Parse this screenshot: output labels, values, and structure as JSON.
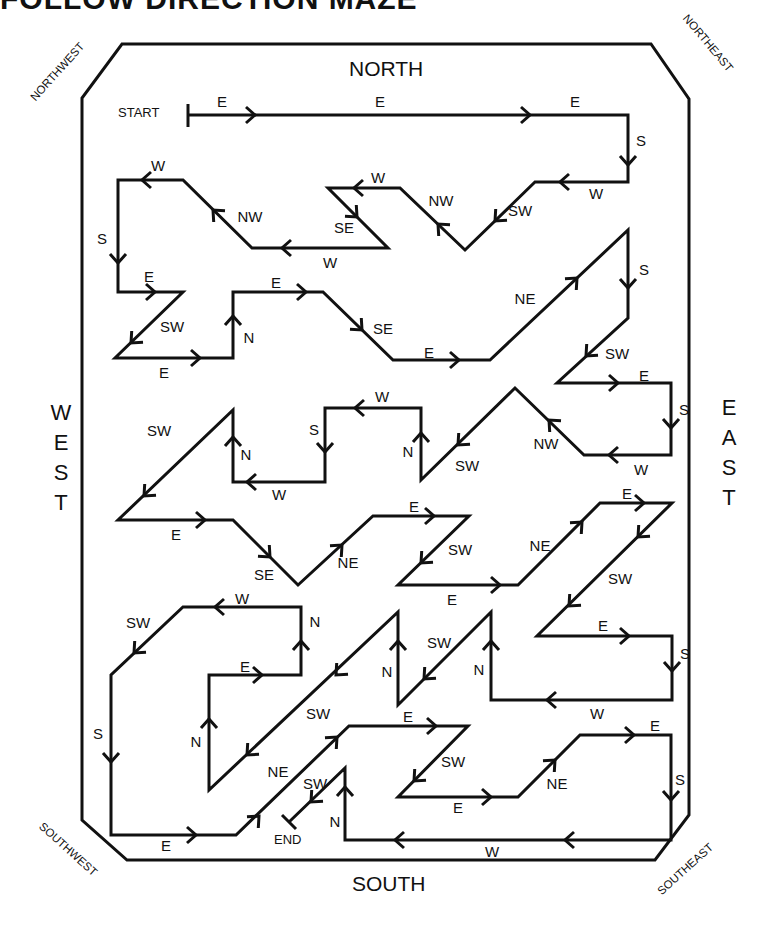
{
  "title": "FOLLOW DIRECTION MAZE",
  "compass": {
    "north": "NORTH",
    "south": "SOUTH",
    "west": [
      "W",
      "E",
      "S",
      "T"
    ],
    "east": [
      "E",
      "A",
      "S",
      "T"
    ],
    "northwest": "NORTHWEST",
    "northeast": "NORTHEAST",
    "southwest": "SOUTHWEST",
    "southeast": "SOUTHEAST"
  },
  "markers": {
    "start": "START",
    "end": "END"
  },
  "colors": {
    "ink": "#111111",
    "background": "#ffffff"
  },
  "path_points": [
    [
      188,
      115
    ],
    [
      628,
      115
    ],
    [
      628,
      182
    ],
    [
      535,
      182
    ],
    [
      465,
      250
    ],
    [
      400,
      188
    ],
    [
      328,
      188
    ],
    [
      388,
      248
    ],
    [
      252,
      248
    ],
    [
      183,
      180
    ],
    [
      118,
      180
    ],
    [
      118,
      292
    ],
    [
      183,
      292
    ],
    [
      115,
      358
    ],
    [
      233,
      358
    ],
    [
      233,
      292
    ],
    [
      323,
      292
    ],
    [
      393,
      360
    ],
    [
      490,
      360
    ],
    [
      628,
      230
    ],
    [
      628,
      318
    ],
    [
      557,
      383
    ],
    [
      671,
      383
    ],
    [
      671,
      455
    ],
    [
      584,
      455
    ],
    [
      515,
      388
    ],
    [
      421,
      480
    ],
    [
      421,
      408
    ],
    [
      325,
      408
    ],
    [
      325,
      482
    ],
    [
      233,
      482
    ],
    [
      233,
      410
    ],
    [
      118,
      520
    ],
    [
      233,
      520
    ],
    [
      298,
      585
    ],
    [
      373,
      516
    ],
    [
      469,
      516
    ],
    [
      398,
      585
    ],
    [
      518,
      585
    ],
    [
      600,
      503
    ],
    [
      672,
      503
    ],
    [
      537,
      636
    ],
    [
      672,
      636
    ],
    [
      672,
      700
    ],
    [
      491,
      700
    ],
    [
      491,
      612
    ],
    [
      398,
      705
    ],
    [
      398,
      612
    ],
    [
      209,
      790
    ],
    [
      209,
      675
    ],
    [
      301,
      675
    ],
    [
      301,
      607
    ],
    [
      183,
      607
    ],
    [
      111,
      675
    ],
    [
      111,
      835
    ],
    [
      236,
      835
    ],
    [
      349,
      726
    ],
    [
      468,
      726
    ],
    [
      398,
      797
    ],
    [
      518,
      797
    ],
    [
      580,
      735
    ],
    [
      671,
      735
    ],
    [
      671,
      840
    ],
    [
      345,
      840
    ],
    [
      345,
      768
    ],
    [
      289,
      822
    ]
  ],
  "direction_labels": [
    {
      "t": "E",
      "x": 222,
      "y": 107
    },
    {
      "t": "E",
      "x": 380,
      "y": 107
    },
    {
      "t": "E",
      "x": 575,
      "y": 107
    },
    {
      "t": "S",
      "x": 641,
      "y": 146
    },
    {
      "t": "W",
      "x": 596,
      "y": 199
    },
    {
      "t": "SW",
      "x": 520,
      "y": 216
    },
    {
      "t": "NW",
      "x": 441,
      "y": 206
    },
    {
      "t": "W",
      "x": 378,
      "y": 183
    },
    {
      "t": "SE",
      "x": 344,
      "y": 233
    },
    {
      "t": "W",
      "x": 330,
      "y": 268
    },
    {
      "t": "NW",
      "x": 250,
      "y": 222
    },
    {
      "t": "W",
      "x": 158,
      "y": 171
    },
    {
      "t": "S",
      "x": 102,
      "y": 244
    },
    {
      "t": "E",
      "x": 149,
      "y": 282
    },
    {
      "t": "SW",
      "x": 172,
      "y": 332
    },
    {
      "t": "E",
      "x": 164,
      "y": 378
    },
    {
      "t": "N",
      "x": 249,
      "y": 343
    },
    {
      "t": "E",
      "x": 276,
      "y": 288
    },
    {
      "t": "SE",
      "x": 383,
      "y": 334
    },
    {
      "t": "E",
      "x": 429,
      "y": 358
    },
    {
      "t": "NE",
      "x": 525,
      "y": 304
    },
    {
      "t": "S",
      "x": 644,
      "y": 275
    },
    {
      "t": "SW",
      "x": 617,
      "y": 359
    },
    {
      "t": "E",
      "x": 644,
      "y": 381
    },
    {
      "t": "S",
      "x": 684,
      "y": 415
    },
    {
      "t": "W",
      "x": 641,
      "y": 475
    },
    {
      "t": "NW",
      "x": 546,
      "y": 449
    },
    {
      "t": "SW",
      "x": 467,
      "y": 471
    },
    {
      "t": "N",
      "x": 408,
      "y": 457
    },
    {
      "t": "W",
      "x": 382,
      "y": 402
    },
    {
      "t": "S",
      "x": 314,
      "y": 435
    },
    {
      "t": "W",
      "x": 279,
      "y": 500
    },
    {
      "t": "N",
      "x": 246,
      "y": 460
    },
    {
      "t": "SW",
      "x": 159,
      "y": 436
    },
    {
      "t": "E",
      "x": 176,
      "y": 540
    },
    {
      "t": "SE",
      "x": 264,
      "y": 580
    },
    {
      "t": "NE",
      "x": 348,
      "y": 568
    },
    {
      "t": "E",
      "x": 414,
      "y": 512
    },
    {
      "t": "SW",
      "x": 460,
      "y": 555
    },
    {
      "t": "E",
      "x": 452,
      "y": 605
    },
    {
      "t": "NE",
      "x": 540,
      "y": 551
    },
    {
      "t": "E",
      "x": 627,
      "y": 499
    },
    {
      "t": "SW",
      "x": 620,
      "y": 584
    },
    {
      "t": "E",
      "x": 603,
      "y": 631
    },
    {
      "t": "S",
      "x": 685,
      "y": 659
    },
    {
      "t": "W",
      "x": 597,
      "y": 719
    },
    {
      "t": "N",
      "x": 479,
      "y": 675
    },
    {
      "t": "SW",
      "x": 439,
      "y": 648
    },
    {
      "t": "N",
      "x": 387,
      "y": 677
    },
    {
      "t": "SW",
      "x": 318,
      "y": 719
    },
    {
      "t": "N",
      "x": 196,
      "y": 747
    },
    {
      "t": "E",
      "x": 245,
      "y": 672
    },
    {
      "t": "N",
      "x": 315,
      "y": 627
    },
    {
      "t": "W",
      "x": 242,
      "y": 604
    },
    {
      "t": "SW",
      "x": 138,
      "y": 628
    },
    {
      "t": "S",
      "x": 98,
      "y": 739
    },
    {
      "t": "E",
      "x": 166,
      "y": 851
    },
    {
      "t": "NE",
      "x": 278,
      "y": 777
    },
    {
      "t": "SW",
      "x": 315,
      "y": 789
    },
    {
      "t": "E",
      "x": 408,
      "y": 722
    },
    {
      "t": "SW",
      "x": 453,
      "y": 767
    },
    {
      "t": "E",
      "x": 458,
      "y": 813
    },
    {
      "t": "NE",
      "x": 557,
      "y": 789
    },
    {
      "t": "E",
      "x": 655,
      "y": 731
    },
    {
      "t": "S",
      "x": 680,
      "y": 785
    },
    {
      "t": "W",
      "x": 492,
      "y": 857
    },
    {
      "t": "N",
      "x": 335,
      "y": 827
    }
  ],
  "arrows": [
    {
      "x": 255,
      "y": 115,
      "d": "E"
    },
    {
      "x": 530,
      "y": 115,
      "d": "E"
    },
    {
      "x": 628,
      "y": 165,
      "d": "S"
    },
    {
      "x": 560,
      "y": 182,
      "d": "W"
    },
    {
      "x": 495,
      "y": 221,
      "d": "SW"
    },
    {
      "x": 438,
      "y": 224,
      "d": "NW"
    },
    {
      "x": 354,
      "y": 188,
      "d": "W"
    },
    {
      "x": 357,
      "y": 217,
      "d": "SE"
    },
    {
      "x": 282,
      "y": 248,
      "d": "W"
    },
    {
      "x": 213,
      "y": 210,
      "d": "NW"
    },
    {
      "x": 142,
      "y": 180,
      "d": "W"
    },
    {
      "x": 118,
      "y": 263,
      "d": "S"
    },
    {
      "x": 155,
      "y": 292,
      "d": "E"
    },
    {
      "x": 131,
      "y": 343,
      "d": "SW"
    },
    {
      "x": 200,
      "y": 358,
      "d": "E"
    },
    {
      "x": 233,
      "y": 316,
      "d": "N"
    },
    {
      "x": 306,
      "y": 292,
      "d": "E"
    },
    {
      "x": 362,
      "y": 330,
      "d": "SE"
    },
    {
      "x": 459,
      "y": 360,
      "d": "E"
    },
    {
      "x": 577,
      "y": 278,
      "d": "NE"
    },
    {
      "x": 628,
      "y": 288,
      "d": "S"
    },
    {
      "x": 586,
      "y": 356,
      "d": "SW"
    },
    {
      "x": 618,
      "y": 383,
      "d": "E"
    },
    {
      "x": 671,
      "y": 428,
      "d": "S"
    },
    {
      "x": 609,
      "y": 455,
      "d": "W"
    },
    {
      "x": 549,
      "y": 420,
      "d": "NW"
    },
    {
      "x": 458,
      "y": 445,
      "d": "SW"
    },
    {
      "x": 421,
      "y": 433,
      "d": "N"
    },
    {
      "x": 355,
      "y": 408,
      "d": "W"
    },
    {
      "x": 325,
      "y": 452,
      "d": "S"
    },
    {
      "x": 247,
      "y": 482,
      "d": "W"
    },
    {
      "x": 233,
      "y": 437,
      "d": "N"
    },
    {
      "x": 144,
      "y": 496,
      "d": "SW"
    },
    {
      "x": 205,
      "y": 520,
      "d": "E"
    },
    {
      "x": 270,
      "y": 557,
      "d": "SE"
    },
    {
      "x": 342,
      "y": 545,
      "d": "NE"
    },
    {
      "x": 434,
      "y": 516,
      "d": "E"
    },
    {
      "x": 421,
      "y": 563,
      "d": "SW"
    },
    {
      "x": 500,
      "y": 585,
      "d": "E"
    },
    {
      "x": 582,
      "y": 522,
      "d": "NE"
    },
    {
      "x": 644,
      "y": 503,
      "d": "E"
    },
    {
      "x": 638,
      "y": 537,
      "d": "SW"
    },
    {
      "x": 569,
      "y": 606,
      "d": "SW"
    },
    {
      "x": 629,
      "y": 636,
      "d": "E"
    },
    {
      "x": 672,
      "y": 671,
      "d": "S"
    },
    {
      "x": 547,
      "y": 700,
      "d": "W"
    },
    {
      "x": 491,
      "y": 641,
      "d": "N"
    },
    {
      "x": 424,
      "y": 679,
      "d": "SW"
    },
    {
      "x": 398,
      "y": 641,
      "d": "N"
    },
    {
      "x": 336,
      "y": 675,
      "d": "SW"
    },
    {
      "x": 247,
      "y": 755,
      "d": "SW"
    },
    {
      "x": 209,
      "y": 719,
      "d": "N"
    },
    {
      "x": 262,
      "y": 675,
      "d": "E"
    },
    {
      "x": 301,
      "y": 641,
      "d": "N"
    },
    {
      "x": 215,
      "y": 607,
      "d": "W"
    },
    {
      "x": 134,
      "y": 653,
      "d": "SW"
    },
    {
      "x": 111,
      "y": 762,
      "d": "S"
    },
    {
      "x": 196,
      "y": 835,
      "d": "E"
    },
    {
      "x": 259,
      "y": 816,
      "d": "NE"
    },
    {
      "x": 337,
      "y": 737,
      "d": "NE"
    },
    {
      "x": 436,
      "y": 726,
      "d": "E"
    },
    {
      "x": 414,
      "y": 781,
      "d": "SW"
    },
    {
      "x": 491,
      "y": 797,
      "d": "E"
    },
    {
      "x": 555,
      "y": 760,
      "d": "NE"
    },
    {
      "x": 634,
      "y": 735,
      "d": "E"
    },
    {
      "x": 671,
      "y": 800,
      "d": "S"
    },
    {
      "x": 565,
      "y": 840,
      "d": "W"
    },
    {
      "x": 395,
      "y": 840,
      "d": "W"
    },
    {
      "x": 345,
      "y": 787,
      "d": "N"
    },
    {
      "x": 311,
      "y": 802,
      "d": "SW"
    }
  ]
}
